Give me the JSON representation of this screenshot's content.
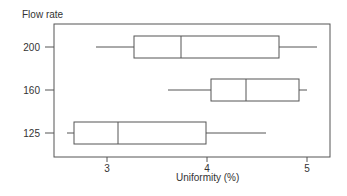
{
  "chart_data": {
    "type": "boxplot",
    "orientation": "horizontal",
    "title": "",
    "ylabel": "Flow rate",
    "xlabel": "Uniformity (%)",
    "xlim": [
      2.47,
      5.2
    ],
    "xticks": [
      3,
      4,
      5
    ],
    "grid": false,
    "legend": null,
    "categories": [
      "200",
      "160",
      "125"
    ],
    "series": [
      {
        "name": "200",
        "whisker_low": 2.89,
        "q1": 3.27,
        "median": 3.74,
        "q3": 4.72,
        "whisker_high": 5.1
      },
      {
        "name": "160",
        "whisker_low": 3.61,
        "q1": 4.04,
        "median": 4.39,
        "q3": 4.92,
        "whisker_high": 5.0
      },
      {
        "name": "125",
        "whisker_low": 2.6,
        "q1": 2.67,
        "median": 3.11,
        "q3": 3.99,
        "whisker_high": 4.59
      }
    ]
  },
  "labels": {
    "y_title": "Flow rate",
    "x_title": "Uniformity (%)"
  },
  "style": {
    "line_color": "#555555",
    "text_color": "#333333"
  }
}
